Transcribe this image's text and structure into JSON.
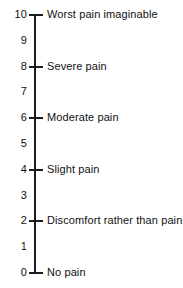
{
  "figure": {
    "name": "vertical-pain-rating-scale",
    "width": 183,
    "height": 288,
    "background_color": "#ffffff",
    "ink_color": "#1c1c1c",
    "text_color": "#111111"
  },
  "axis": {
    "orientation": "vertical",
    "min": 0,
    "max": 10,
    "top_y_px": 15,
    "bottom_y_px": 273,
    "line_x_px": 35,
    "line_width_px": 2,
    "tick_left_x_px": 29,
    "tick_right_x_px": 43,
    "number_right_edge_px": 27,
    "descriptor_left_px": 47
  },
  "chart_data": {
    "type": "scale",
    "title": "",
    "xlabel": "",
    "ylabel": "",
    "ylim": [
      0,
      10
    ],
    "grid": false,
    "legend": "none",
    "orientation": "vertical",
    "tick_values": [
      10,
      9,
      8,
      7,
      6,
      5,
      4,
      3,
      2,
      1,
      0
    ],
    "tick_labels": [
      "10",
      "9",
      "8",
      "7",
      "6",
      "5",
      "4",
      "3",
      "2",
      "1",
      "0"
    ],
    "annotations": [
      {
        "value": 10,
        "text": "Worst pain imaginable",
        "major": true
      },
      {
        "value": 8,
        "text": "Severe pain",
        "major": true
      },
      {
        "value": 6,
        "text": "Moderate pain",
        "major": true
      },
      {
        "value": 4,
        "text": "Slight pain",
        "major": true
      },
      {
        "value": 2,
        "text": "Discomfort rather than pain",
        "major": true
      },
      {
        "value": 0,
        "text": "No pain",
        "major": true
      }
    ]
  },
  "ticks": [
    {
      "value": 10,
      "label": "10",
      "has_mark": true,
      "descriptor": "Worst pain imaginable"
    },
    {
      "value": 9,
      "label": "9",
      "has_mark": false,
      "descriptor": ""
    },
    {
      "value": 8,
      "label": "8",
      "has_mark": true,
      "descriptor": "Severe pain"
    },
    {
      "value": 7,
      "label": "7",
      "has_mark": false,
      "descriptor": ""
    },
    {
      "value": 6,
      "label": "6",
      "has_mark": true,
      "descriptor": "Moderate pain"
    },
    {
      "value": 5,
      "label": "5",
      "has_mark": false,
      "descriptor": ""
    },
    {
      "value": 4,
      "label": "4",
      "has_mark": true,
      "descriptor": "Slight pain"
    },
    {
      "value": 3,
      "label": "3",
      "has_mark": false,
      "descriptor": ""
    },
    {
      "value": 2,
      "label": "2",
      "has_mark": true,
      "descriptor": "Discomfort rather than pain"
    },
    {
      "value": 1,
      "label": "1",
      "has_mark": false,
      "descriptor": ""
    },
    {
      "value": 0,
      "label": "0",
      "has_mark": true,
      "descriptor": "No pain"
    }
  ]
}
